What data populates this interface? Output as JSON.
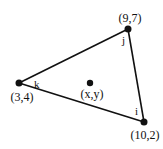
{
  "diagram": {
    "type": "triangle-with-interior-point",
    "stroke_color": "#111111",
    "background": "#ffffff",
    "vertices": [
      {
        "name": "j",
        "coord_label": "(9,7)",
        "px": [
          128,
          29
        ]
      },
      {
        "name": "k",
        "coord_label": "(3,4)",
        "px": [
          19,
          83
        ]
      },
      {
        "name": "i",
        "coord_label": "(10,2)",
        "px": [
          144,
          122
        ]
      }
    ],
    "edges": [
      [
        "j",
        "k"
      ],
      [
        "k",
        "i"
      ],
      [
        "i",
        "j"
      ]
    ],
    "interior_point": {
      "label": "(x,y)",
      "px": [
        90,
        83
      ]
    }
  }
}
